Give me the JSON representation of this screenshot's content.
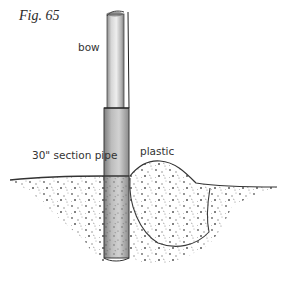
{
  "figure": {
    "number_label": "Fig. 65",
    "labels": {
      "bow": "bow",
      "section_pipe": "30\" section pipe",
      "plastic": "plastic"
    }
  },
  "colors": {
    "background": "#ffffff",
    "ink": "#2a2a2a",
    "pipe_shade": "#9a9a9a",
    "pipe_highlight": "#e6e6e6",
    "soil_speckle": "#555555"
  }
}
